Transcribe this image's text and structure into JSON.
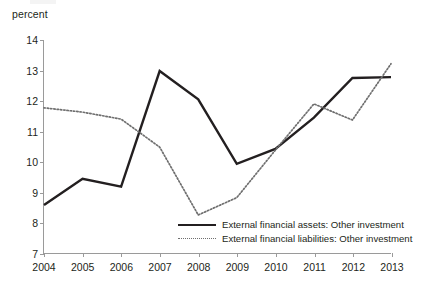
{
  "axis_unit_label": "percent",
  "legend": {
    "items": [
      {
        "label": "External financial assets: Other investment",
        "style": "solid",
        "color": "#231f20"
      },
      {
        "label": "External financial liabilities: Other investment",
        "style": "dotted",
        "color": "#6f6f6f"
      }
    ]
  },
  "chart_data": {
    "type": "line",
    "title": "",
    "xlabel": "",
    "ylabel": "percent",
    "categories": [
      "2004",
      "2005",
      "2006",
      "2007",
      "2008",
      "2009",
      "2010",
      "2011",
      "2012",
      "2013"
    ],
    "x": [
      2004,
      2005,
      2006,
      2007,
      2008,
      2009,
      2010,
      2011,
      2012,
      2013
    ],
    "xlim": [
      2004,
      2013
    ],
    "ylim": [
      7,
      14
    ],
    "yticks": [
      7,
      8,
      9,
      10,
      11,
      12,
      13,
      14
    ],
    "grid": false,
    "legend_position": "inside-bottom-right",
    "series": [
      {
        "name": "External financial assets: Other investment",
        "style": "solid",
        "color": "#231f20",
        "values": [
          8.58,
          9.44,
          9.18,
          12.98,
          12.05,
          9.93,
          10.42,
          11.45,
          12.75,
          12.78
        ]
      },
      {
        "name": "External financial liabilities: Other investment",
        "style": "dotted",
        "color": "#6f6f6f",
        "values": [
          11.77,
          11.63,
          11.4,
          10.48,
          8.25,
          8.82,
          10.38,
          11.9,
          11.37,
          13.22
        ]
      }
    ]
  }
}
